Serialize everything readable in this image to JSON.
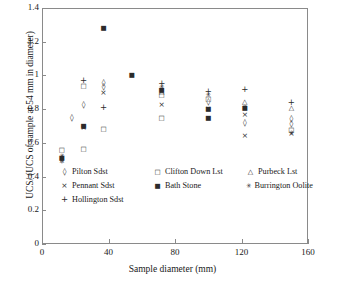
{
  "chart_data": {
    "type": "scatter",
    "title": "",
    "xlabel": "Sample diameter (mm)",
    "ylabel": "UCS/ (UCS of sample at 54 mm in diameter)",
    "xlim": [
      0,
      160
    ],
    "ylim": [
      0,
      1.4
    ],
    "xticks": [
      0,
      40,
      80,
      120,
      160
    ],
    "yticks": [
      0,
      0.2,
      0.4,
      0.6,
      0.8,
      1,
      1.2,
      1.4
    ],
    "xtick_labels": [
      "0",
      "40",
      "80",
      "120",
      "160"
    ],
    "ytick_labels": [
      "0",
      "0.2",
      "0.4",
      "0.6",
      "0.8",
      "1",
      "1.2",
      "1.4"
    ],
    "grid": false,
    "legend_position": "inside-lower-left",
    "series": [
      {
        "name": "Pilton Sdst",
        "marker": "diamond",
        "points": [
          {
            "x": 12,
            "y": 0.5
          },
          {
            "x": 18,
            "y": 0.745
          },
          {
            "x": 25,
            "y": 0.825
          },
          {
            "x": 37,
            "y": 0.955
          },
          {
            "x": 37,
            "y": 0.93
          },
          {
            "x": 100,
            "y": 0.845
          },
          {
            "x": 122,
            "y": 0.715
          },
          {
            "x": 150,
            "y": 0.74
          },
          {
            "x": 150,
            "y": 0.71
          }
        ]
      },
      {
        "name": "Pennant Sdst",
        "marker": "cross",
        "points": [
          {
            "x": 12,
            "y": 0.495
          },
          {
            "x": 25,
            "y": 0.69
          },
          {
            "x": 37,
            "y": 0.895
          },
          {
            "x": 72,
            "y": 0.825
          },
          {
            "x": 100,
            "y": 0.8
          },
          {
            "x": 122,
            "y": 0.765
          },
          {
            "x": 122,
            "y": 0.64
          },
          {
            "x": 150,
            "y": 0.655
          }
        ]
      },
      {
        "name": "Hollington Sdst",
        "marker": "plus",
        "points": [
          {
            "x": 25,
            "y": 0.975
          },
          {
            "x": 37,
            "y": 0.81
          },
          {
            "x": 72,
            "y": 0.955
          },
          {
            "x": 100,
            "y": 0.905
          },
          {
            "x": 122,
            "y": 0.92
          },
          {
            "x": 150,
            "y": 0.84
          }
        ]
      },
      {
        "name": "Clifton Down Lst",
        "marker": "square",
        "points": [
          {
            "x": 12,
            "y": 0.555
          },
          {
            "x": 25,
            "y": 0.935
          },
          {
            "x": 25,
            "y": 0.565
          },
          {
            "x": 37,
            "y": 0.68
          },
          {
            "x": 72,
            "y": 0.885
          },
          {
            "x": 72,
            "y": 0.745
          },
          {
            "x": 100,
            "y": 0.86
          },
          {
            "x": 150,
            "y": 0.675
          }
        ]
      },
      {
        "name": "Bath Stone",
        "marker": "fsquare",
        "points": [
          {
            "x": 12,
            "y": 0.51
          },
          {
            "x": 25,
            "y": 0.7
          },
          {
            "x": 37,
            "y": 1.28
          },
          {
            "x": 54,
            "y": 1.0
          },
          {
            "x": 72,
            "y": 0.915
          },
          {
            "x": 100,
            "y": 0.8
          },
          {
            "x": 100,
            "y": 0.745
          },
          {
            "x": 122,
            "y": 0.805
          }
        ]
      },
      {
        "name": "Purbeck Lst",
        "marker": "triangle",
        "points": [
          {
            "x": 72,
            "y": 0.9
          },
          {
            "x": 122,
            "y": 0.845
          },
          {
            "x": 150,
            "y": 0.805
          }
        ]
      },
      {
        "name": "Burrington Oolite",
        "marker": "star",
        "points": [
          {
            "x": 12,
            "y": 0.525
          },
          {
            "x": 25,
            "y": 0.695
          },
          {
            "x": 72,
            "y": 0.93
          },
          {
            "x": 100,
            "y": 0.885
          },
          {
            "x": 122,
            "y": 0.81
          },
          {
            "x": 150,
            "y": 0.66
          }
        ]
      }
    ],
    "legend_entries": [
      {
        "label": "Pilton Sdst",
        "marker": "diamond"
      },
      {
        "label": "Clifton Down Lst",
        "marker": "square"
      },
      {
        "label": "Purbeck Lst",
        "marker": "triangle"
      },
      {
        "label": "Pennant Sdst",
        "marker": "cross"
      },
      {
        "label": "Bath Stone",
        "marker": "fsquare"
      },
      {
        "label": "Burrington Oolite",
        "marker": "star"
      },
      {
        "label": "Hollington Sdst",
        "marker": "plus"
      }
    ]
  }
}
